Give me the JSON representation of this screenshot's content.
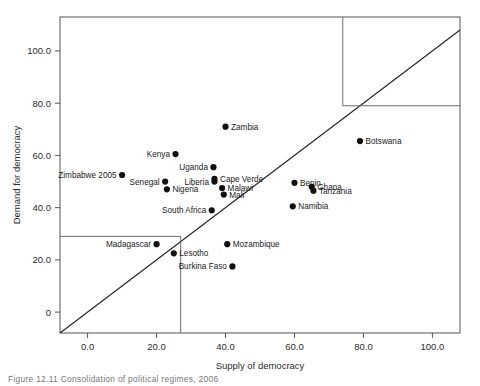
{
  "chart_data": {
    "type": "scatter",
    "title": "",
    "xlabel": "Supply of democracy",
    "ylabel": "Demand for democracy",
    "xlim": [
      -8,
      108
    ],
    "ylim": [
      -8,
      113
    ],
    "xticks": [
      0,
      20,
      40,
      60,
      80,
      100
    ],
    "xtick_labels": [
      "0.0",
      "20.0",
      "40.0",
      "60.0",
      "80.0",
      "100.0"
    ],
    "yticks": [
      0,
      20,
      40,
      60,
      80,
      100
    ],
    "ytick_labels": [
      "0",
      "20.0",
      "40.0",
      "60.0",
      "80.0",
      "100.0"
    ],
    "grid": false,
    "legend": "none",
    "reference_lines": [
      {
        "name": "diagonal",
        "type": "line",
        "from": [
          -8,
          -8
        ],
        "to": [
          108,
          108
        ]
      },
      {
        "name": "lower-vertical-divider",
        "type": "vline",
        "x": 27
      },
      {
        "name": "lower-horizontal-divider",
        "type": "hline",
        "y": 29
      },
      {
        "name": "upper-vertical-divider",
        "type": "vline",
        "x": 74
      },
      {
        "name": "upper-horizontal-divider",
        "type": "hline",
        "y": 79
      }
    ],
    "points": [
      {
        "label": "Zambia",
        "x": 40.0,
        "y": 71.0,
        "label_side": "right"
      },
      {
        "label": "Botswana",
        "x": 79.0,
        "y": 65.5,
        "label_side": "right"
      },
      {
        "label": "Kenya",
        "x": 25.5,
        "y": 60.5,
        "label_side": "left"
      },
      {
        "label": "Uganda",
        "x": 36.5,
        "y": 55.5,
        "label_side": "left"
      },
      {
        "label": "Zimbabwe 2005",
        "x": 10.0,
        "y": 52.5,
        "label_side": "left"
      },
      {
        "label": "Cape Verde",
        "x": 36.8,
        "y": 51.0,
        "label_side": "right"
      },
      {
        "label": "Liberia",
        "x": 36.8,
        "y": 50.0,
        "label_side": "left"
      },
      {
        "label": "Senegal",
        "x": 22.5,
        "y": 50.0,
        "label_side": "left"
      },
      {
        "label": "Benin",
        "x": 60.0,
        "y": 49.5,
        "label_side": "right"
      },
      {
        "label": "Ghana",
        "x": 65.0,
        "y": 48.0,
        "label_side": "right"
      },
      {
        "label": "Malawi",
        "x": 39.0,
        "y": 47.5,
        "label_side": "right"
      },
      {
        "label": "Nigeria",
        "x": 23.0,
        "y": 47.0,
        "label_side": "right"
      },
      {
        "label": "Tanzania",
        "x": 65.5,
        "y": 46.5,
        "label_side": "right"
      },
      {
        "label": "Mali",
        "x": 39.5,
        "y": 45.0,
        "label_side": "right"
      },
      {
        "label": "Namibia",
        "x": 59.5,
        "y": 40.5,
        "label_side": "right"
      },
      {
        "label": "South Africa",
        "x": 36.0,
        "y": 39.0,
        "label_side": "left"
      },
      {
        "label": "Madagascar",
        "x": 20.0,
        "y": 26.0,
        "label_side": "left"
      },
      {
        "label": "Mozambique",
        "x": 40.5,
        "y": 26.0,
        "label_side": "right"
      },
      {
        "label": "Lesotho",
        "x": 25.0,
        "y": 22.5,
        "label_side": "right"
      },
      {
        "label": "Burkina Faso",
        "x": 42.0,
        "y": 17.5,
        "label_side": "left"
      }
    ]
  },
  "caption": "Figure 12.11  Consolidation of political regimes, 2006"
}
